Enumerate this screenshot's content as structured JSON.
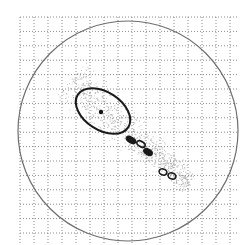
{
  "figure": {
    "width": 248,
    "height": 245,
    "background": "#ffffff",
    "grid": {
      "x0": 20,
      "y0": 17,
      "x1": 237,
      "y1": 244,
      "dx": 14.0,
      "dy": 14.4,
      "color": "#8a8a8a",
      "style": "dotted"
    },
    "boundary_circle": {
      "cx": 128,
      "cy": 131,
      "r": 110,
      "color": "#6e6e6e",
      "stroke_width": 1.2
    },
    "speckle_cloud": {
      "color": "#9a9a9a",
      "axis_start": [
        70,
        80
      ],
      "axis_end": [
        190,
        185
      ],
      "spread": 22,
      "count": 900
    },
    "error_ellipse": {
      "cx": 103,
      "cy": 111,
      "rx": 30,
      "ry": 19,
      "rotation_deg": 33,
      "color": "#1a1a1a",
      "stroke_width": 2
    },
    "centroid_dot": {
      "cx": 101,
      "cy": 112,
      "r": 2.2,
      "color": "#111111"
    },
    "blobs": [
      {
        "cx": 131,
        "cy": 140,
        "rx": 5,
        "ry": 2.6,
        "rotation_deg": 30,
        "filled": true
      },
      {
        "cx": 141,
        "cy": 144,
        "rx": 4.5,
        "ry": 2.6,
        "rotation_deg": 30,
        "filled": false
      },
      {
        "cx": 148,
        "cy": 152,
        "rx": 4.5,
        "ry": 2.6,
        "rotation_deg": 30,
        "filled": true
      },
      {
        "cx": 163,
        "cy": 172,
        "rx": 4,
        "ry": 3,
        "rotation_deg": 20,
        "filled": false
      },
      {
        "cx": 172,
        "cy": 176,
        "rx": 4,
        "ry": 3,
        "rotation_deg": 20,
        "filled": false
      }
    ]
  }
}
